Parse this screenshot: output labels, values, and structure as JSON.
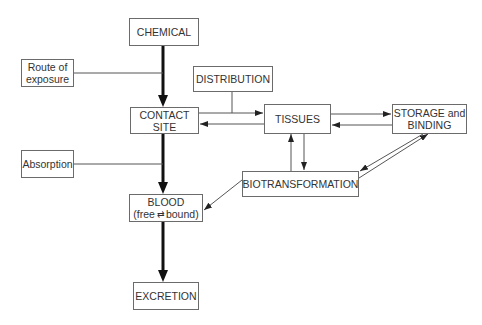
{
  "nodes": {
    "chemical": {
      "label": "CHEMICAL"
    },
    "route": {
      "line1": "Route of",
      "line2": "exposure"
    },
    "distribution": {
      "label": "DISTRIBUTION"
    },
    "contact": {
      "line1": "CONTACT",
      "line2": "SITE"
    },
    "tissues": {
      "label": "TISSUES"
    },
    "storage": {
      "line1": "STORAGE and",
      "line2": "BINDING"
    },
    "absorption": {
      "label": "Absorption"
    },
    "biotransformation": {
      "label": "BIOTRANSFORMATION"
    },
    "blood": {
      "line1": "BLOOD",
      "line2_a": "(free",
      "line2_eq": "⇄",
      "line2_b": "bound)"
    },
    "excretion": {
      "label": "EXCRETION"
    }
  },
  "edges": [
    {
      "from": "CHEMICAL",
      "to": "CONTACT SITE",
      "style": "thick"
    },
    {
      "from": "Route of exposure",
      "to": "CHEMICAL→CONTACT SITE arrow",
      "style": "line"
    },
    {
      "from": "DISTRIBUTION",
      "to": "CONTACT SITE→TISSUES arrow",
      "style": "line"
    },
    {
      "from": "CONTACT SITE",
      "to": "TISSUES",
      "style": "arrow"
    },
    {
      "from": "TISSUES",
      "to": "CONTACT SITE",
      "style": "arrow"
    },
    {
      "from": "TISSUES",
      "to": "STORAGE and BINDING",
      "style": "arrow"
    },
    {
      "from": "STORAGE and BINDING",
      "to": "TISSUES",
      "style": "arrow"
    },
    {
      "from": "BIOTRANSFORMATION",
      "to": "TISSUES",
      "style": "arrow"
    },
    {
      "from": "TISSUES",
      "to": "BIOTRANSFORMATION",
      "style": "arrow"
    },
    {
      "from": "STORAGE and BINDING",
      "to": "BIOTRANSFORMATION",
      "style": "arrow"
    },
    {
      "from": "BIOTRANSFORMATION",
      "to": "STORAGE and BINDING",
      "style": "arrow"
    },
    {
      "from": "BIOTRANSFORMATION",
      "to": "BLOOD",
      "style": "arrow"
    },
    {
      "from": "CONTACT SITE",
      "to": "BLOOD",
      "style": "thick"
    },
    {
      "from": "Absorption",
      "to": "CONTACT SITE→BLOOD arrow",
      "style": "line"
    },
    {
      "from": "BLOOD",
      "to": "EXCRETION",
      "style": "thick"
    }
  ]
}
